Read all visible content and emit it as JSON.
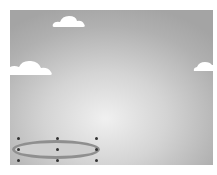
{
  "canvas": {
    "background": "radial-gradient gray",
    "colors": {
      "center": "#f0f0f0",
      "edge": "#a4a4a4",
      "cloud": "#ffffff",
      "ellipse_fill": "#cfcfcf",
      "ellipse_border": "#8f8f8f",
      "handle": "#333333"
    }
  },
  "clouds": [
    {
      "name": "cloud-top",
      "x": 42,
      "y": 4,
      "w": 34,
      "h": 14
    },
    {
      "name": "cloud-left",
      "x": 0,
      "y": 49,
      "w": 43,
      "h": 17
    },
    {
      "name": "cloud-right",
      "x": 183,
      "y": 50,
      "w": 22,
      "h": 12
    }
  ],
  "selection": {
    "shape": "ellipse",
    "handles": [
      {
        "x": 8,
        "y": 128
      },
      {
        "x": 47,
        "y": 128
      },
      {
        "x": 86,
        "y": 128
      },
      {
        "x": 8,
        "y": 139
      },
      {
        "x": 47,
        "y": 139
      },
      {
        "x": 86,
        "y": 139
      },
      {
        "x": 8,
        "y": 150
      },
      {
        "x": 47,
        "y": 150
      },
      {
        "x": 86,
        "y": 150
      }
    ]
  }
}
